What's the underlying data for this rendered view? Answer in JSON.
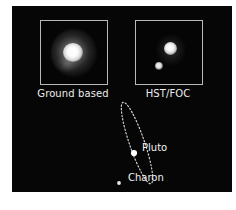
{
  "figure": {
    "background_color": "#060606",
    "page_background_color": "#ffffff",
    "panel_border_color": "#b9b9b9",
    "text_color": "#ececec"
  },
  "panels": [
    {
      "id": "ground-based",
      "caption": "Ground based",
      "description": "unresolved fuzzy blob of Pluto-Charon"
    },
    {
      "id": "hst-foc",
      "caption": "HST/FOC",
      "description": "two resolved point sources"
    }
  ],
  "orbit_diagram": {
    "bodies": [
      {
        "name": "Pluto",
        "label": "Pluto",
        "marker": "bright-dot"
      },
      {
        "name": "Charon",
        "label": "Charon",
        "marker": "small-dot"
      }
    ],
    "path_style": "dotted-ellipse",
    "path_color": "#d0d0d0"
  }
}
